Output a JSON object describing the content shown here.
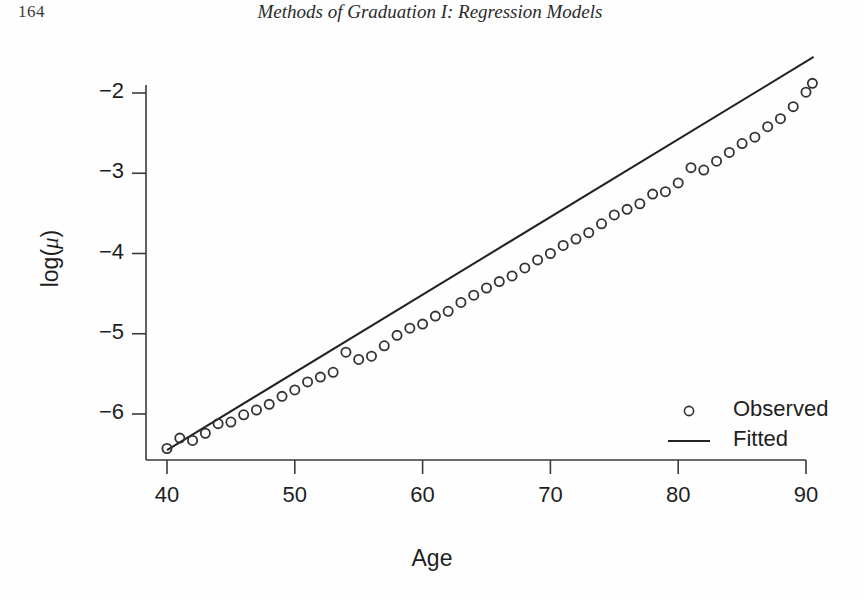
{
  "page": {
    "number": "164",
    "running_head": "Methods of Graduation I: Regression Models"
  },
  "chart_data": {
    "type": "scatter",
    "title": "",
    "xlabel": "Age",
    "ylabel": "log(μ)",
    "ylabel_plain": "log(mu)",
    "xlim": [
      39,
      91
    ],
    "ylim": [
      -6.6,
      -1.45
    ],
    "xticks": [
      40,
      50,
      60,
      70,
      80,
      90
    ],
    "xtick_labels": [
      "40",
      "50",
      "60",
      "70",
      "80",
      "90"
    ],
    "yticks": [
      -2,
      -3,
      -4,
      -5,
      -6
    ],
    "ytick_labels": [
      "−2",
      "−3",
      "−4",
      "−5",
      "−6"
    ],
    "grid": false,
    "legend_position": "lower right",
    "legend": [
      {
        "label": "Observed",
        "marker": "circle"
      },
      {
        "label": "Fitted",
        "marker": "line"
      }
    ],
    "series": [
      {
        "name": "Observed",
        "marker": "open-circle",
        "color": "#333333",
        "x": [
          40,
          41,
          42,
          43,
          44,
          45,
          46,
          47,
          48,
          49,
          50,
          51,
          52,
          53,
          54,
          55,
          56,
          57,
          58,
          59,
          60,
          61,
          62,
          63,
          64,
          65,
          66,
          67,
          68,
          69,
          70,
          71,
          72,
          73,
          74,
          75,
          76,
          77,
          78,
          79,
          80,
          81,
          82,
          83,
          84,
          85,
          86,
          87,
          88,
          89,
          90
        ],
        "y": [
          -6.43,
          -6.3,
          -6.33,
          -6.24,
          -6.12,
          -6.1,
          -6.01,
          -5.95,
          -5.88,
          -5.78,
          -5.7,
          -5.6,
          -5.54,
          -5.48,
          -5.23,
          -5.32,
          -5.28,
          -5.15,
          -5.02,
          -4.93,
          -4.88,
          -4.78,
          -4.72,
          -4.61,
          -4.52,
          -4.43,
          -4.35,
          -4.28,
          -4.18,
          -4.08,
          -4.0,
          -3.9,
          -3.82,
          -3.74,
          -3.63,
          -3.52,
          -3.45,
          -3.38,
          -3.26,
          -3.23,
          -3.12,
          -2.93,
          -2.96,
          -2.85,
          -2.74,
          -2.63,
          -2.55,
          -2.42,
          -2.32,
          -2.17,
          -1.99
        ],
        "x_draw": [
          40,
          41,
          42,
          43,
          44,
          45,
          46,
          47,
          48,
          49,
          50,
          51,
          52,
          53,
          54,
          55,
          56,
          57,
          58,
          59,
          60,
          61,
          62,
          63,
          64,
          65,
          66,
          67,
          68,
          69,
          70,
          71,
          72,
          73,
          74,
          75,
          76,
          77,
          78,
          79,
          80,
          81,
          82,
          83,
          84,
          85,
          86,
          87,
          88,
          89,
          90,
          90.5
        ],
        "y_draw": [
          -6.43,
          -6.3,
          -6.33,
          -6.24,
          -6.12,
          -6.1,
          -6.01,
          -5.95,
          -5.88,
          -5.78,
          -5.7,
          -5.6,
          -5.54,
          -5.48,
          -5.23,
          -5.32,
          -5.28,
          -5.15,
          -5.02,
          -4.93,
          -4.88,
          -4.78,
          -4.72,
          -4.61,
          -4.52,
          -4.43,
          -4.35,
          -4.28,
          -4.18,
          -4.08,
          -4.0,
          -3.9,
          -3.82,
          -3.74,
          -3.63,
          -3.52,
          -3.45,
          -3.38,
          -3.26,
          -3.23,
          -3.12,
          -2.93,
          -2.96,
          -2.85,
          -2.74,
          -2.63,
          -2.55,
          -2.42,
          -2.32,
          -2.17,
          -1.99,
          -1.88
        ]
      },
      {
        "name": "Fitted",
        "marker": "line",
        "color": "#222222",
        "line_endpoints": {
          "x0": 40.0,
          "y0": -6.45,
          "x1": 90.6,
          "y1": -1.55
        },
        "slope": 0.0968,
        "intercept": -10.32
      }
    ]
  },
  "figure": {
    "legend_observed": "Observed",
    "legend_fitted": "Fitted"
  }
}
